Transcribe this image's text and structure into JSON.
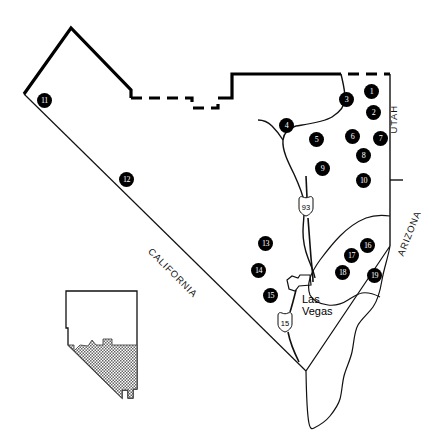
{
  "map": {
    "title": "Southern Nevada Site Location Map",
    "region": "Southern Nevada (Clark, Lincoln and Nye County area)",
    "projection_note": "Shaded area of inset shows map extent",
    "colors": {
      "land": "#ffffff",
      "outline": "#000000",
      "marker_fill": "#000000",
      "marker_text": "#ffffff",
      "inset_shade": "#808080",
      "road": "#1a1a1a"
    },
    "state_labels": [
      {
        "name": "california-label",
        "text": "CALIFORNIA",
        "x": 150,
        "y": 244,
        "rotate": 45
      },
      {
        "name": "utah-label",
        "text": "UTAH",
        "x": 393,
        "y": 128,
        "rotate": -90
      },
      {
        "name": "arizona-label",
        "text": "ARIZONA",
        "x": 400,
        "y": 250,
        "rotate": -68
      }
    ],
    "city_labels": [
      {
        "name": "las-vegas-label",
        "line1": "Las",
        "line2": "Vegas",
        "x": 302,
        "y": 293
      }
    ],
    "highway_shields": [
      {
        "name": "us-93-shield",
        "type": "us",
        "number": "93",
        "x": 305,
        "y": 206
      },
      {
        "name": "i-15-shield",
        "type": "us",
        "number": "15",
        "x": 284,
        "y": 322
      }
    ],
    "markers": [
      {
        "id": 1,
        "label": "1",
        "x": 364,
        "y": 84
      },
      {
        "id": 2,
        "label": "2",
        "x": 366,
        "y": 105
      },
      {
        "id": 3,
        "label": "3",
        "x": 339,
        "y": 92
      },
      {
        "id": 4,
        "label": "4",
        "x": 279,
        "y": 118
      },
      {
        "id": 5,
        "label": "5",
        "x": 309,
        "y": 132
      },
      {
        "id": 6,
        "label": "6",
        "x": 345,
        "y": 129
      },
      {
        "id": 7,
        "label": "7",
        "x": 373,
        "y": 131
      },
      {
        "id": 8,
        "label": "8",
        "x": 356,
        "y": 148
      },
      {
        "id": 9,
        "label": "9",
        "x": 315,
        "y": 161
      },
      {
        "id": 10,
        "label": "10",
        "x": 356,
        "y": 173
      },
      {
        "id": 11,
        "label": "11",
        "x": 37,
        "y": 93
      },
      {
        "id": 12,
        "label": "12",
        "x": 119,
        "y": 172
      },
      {
        "id": 13,
        "label": "13",
        "x": 258,
        "y": 236
      },
      {
        "id": 14,
        "label": "14",
        "x": 251,
        "y": 263
      },
      {
        "id": 15,
        "label": "15",
        "x": 263,
        "y": 288
      },
      {
        "id": 16,
        "label": "16",
        "x": 360,
        "y": 238
      },
      {
        "id": 17,
        "label": "17",
        "x": 344,
        "y": 248
      },
      {
        "id": 18,
        "label": "18",
        "x": 335,
        "y": 265
      },
      {
        "id": 19,
        "label": "19",
        "x": 367,
        "y": 268
      }
    ]
  }
}
